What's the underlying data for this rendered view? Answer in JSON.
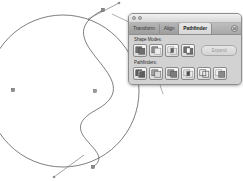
{
  "app": {
    "title": "Pathfinder Panel",
    "panel_title": "Pathfinder"
  },
  "window_controls": [
    {
      "name": "close",
      "color": "#c2c2c2"
    },
    {
      "name": "minimize",
      "color": "#c2c2c2"
    }
  ],
  "panel": {
    "tabs": [
      {
        "id": "transform",
        "label": "Transform",
        "active": false
      },
      {
        "id": "align",
        "label": "Align",
        "active": false
      },
      {
        "id": "pathfinder",
        "label": "Pathfinder",
        "active": true
      }
    ],
    "menu_button_label": "Panel Menu",
    "shape_modes": {
      "label": "Shape Modes:",
      "buttons": [
        {
          "id": "unite",
          "label": "Unite",
          "icon": "unite-icon"
        },
        {
          "id": "minus-front",
          "label": "Minus Front",
          "icon": "minus-front-icon"
        },
        {
          "id": "intersect",
          "label": "Intersect",
          "icon": "intersect-icon"
        },
        {
          "id": "exclude",
          "label": "Exclude",
          "icon": "exclude-icon"
        }
      ],
      "expand_label": "Expand",
      "expand_enabled": false
    },
    "pathfinders": {
      "label": "Pathfinders:",
      "buttons": [
        {
          "id": "divide",
          "label": "Divide",
          "icon": "divide-icon"
        },
        {
          "id": "trim",
          "label": "Trim",
          "icon": "trim-icon"
        },
        {
          "id": "merge",
          "label": "Merge",
          "icon": "merge-icon"
        },
        {
          "id": "crop",
          "label": "Crop",
          "icon": "crop-icon"
        },
        {
          "id": "outline",
          "label": "Outline",
          "icon": "outline-icon"
        },
        {
          "id": "minus-back",
          "label": "Minus Back",
          "icon": "minus-back-icon"
        }
      ]
    }
  },
  "artwork": {
    "description": "Yin-yang S-curve path with selected anchor points and direction handles",
    "stroke_color": "#585858",
    "anchor_color": "#6e6e6e",
    "circle": {
      "cx": 63,
      "cy": 91,
      "r": 76
    },
    "anchor_points": [
      {
        "x": 103,
        "y": 10
      },
      {
        "x": 13,
        "y": 90
      },
      {
        "x": 93,
        "y": 167
      },
      {
        "x": 95,
        "y": 91
      }
    ],
    "handles": [
      {
        "x1": 90,
        "y1": 18,
        "x2": 118,
        "y2": 4
      },
      {
        "x1": 55,
        "y1": 176,
        "x2": 82,
        "y2": 156
      }
    ]
  },
  "callouts": [
    {
      "id": "panel-leader",
      "label": "leader-line-to-panel"
    },
    {
      "id": "pathfinder-leader",
      "label": "leader-line-to-pathfinders"
    }
  ]
}
